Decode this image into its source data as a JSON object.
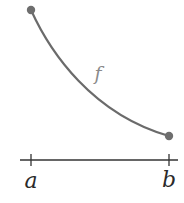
{
  "diagram": {
    "function_label": "f",
    "axis_labels": {
      "left": "a",
      "right": "b"
    },
    "curve": {
      "description": "decreasing convex curve from (a, f(a)) to (b, f(b))",
      "start": "f(a)",
      "end": "f(b)"
    },
    "colors": {
      "curve": "#6b6b6b",
      "endpoints": "#6e6e6e",
      "axis": "#333333",
      "function_label": "#8a8a8a",
      "axis_labels": "#2a2a2a"
    }
  }
}
